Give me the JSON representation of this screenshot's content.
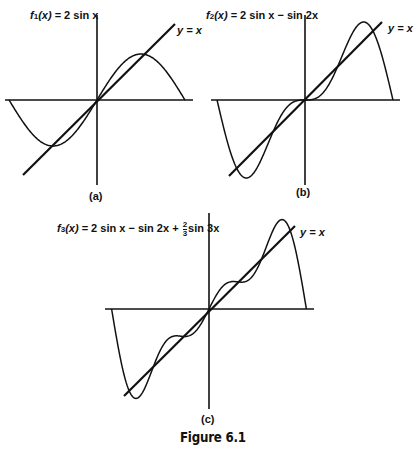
{
  "caption": "Figure 6.1",
  "panels": [
    {
      "tag": "(a)",
      "title": {
        "fname": "f",
        "sub": "1",
        "arg": "(x)",
        "expr": " = 2 sin x"
      },
      "line_label": "y = x"
    },
    {
      "tag": "(b)",
      "title": {
        "fname": "f",
        "sub": "2",
        "arg": "(x)",
        "expr": " = 2 sin x − sin 2x"
      },
      "line_label": "y = x"
    },
    {
      "tag": "(c)",
      "title": {
        "fname": "f",
        "sub": "3",
        "arg": "(x)",
        "expr_a": " = 2 sin x − sin 2x + ",
        "frac_num": "2",
        "frac_den": "3",
        "expr_b": "sin 3x"
      },
      "line_label": "y = x"
    }
  ],
  "chart_data": [
    {
      "type": "line",
      "title": "f1(x) = 2 sin x",
      "panel": "(a)",
      "x_range": [
        -3.14159,
        3.14159
      ],
      "series": [
        {
          "name": "f1(x) = 2 sin x",
          "x": [
            -3.14,
            -2.36,
            -1.57,
            -0.79,
            0,
            0.79,
            1.57,
            2.36,
            3.14
          ],
          "values": [
            0,
            -1.41,
            -2,
            -1.41,
            0,
            1.41,
            2,
            1.41,
            0
          ]
        },
        {
          "name": "y = x",
          "x": [
            -2.8,
            2.8
          ],
          "values": [
            -2.8,
            2.8
          ]
        }
      ],
      "xlabel": "",
      "ylabel": "",
      "grid": false
    },
    {
      "type": "line",
      "title": "f2(x) = 2 sin x − sin 2x",
      "panel": "(b)",
      "x_range": [
        -3.14159,
        3.14159
      ],
      "series": [
        {
          "name": "f2(x) = 2 sin x − sin 2x",
          "x": [
            -3.14,
            -2.09,
            -1.57,
            -0.79,
            0,
            0.79,
            1.57,
            2.09,
            3.14
          ],
          "values": [
            0,
            -2.6,
            -2,
            -0.41,
            0,
            0.41,
            2,
            2.6,
            0
          ]
        },
        {
          "name": "y = x",
          "x": [
            -2.8,
            2.8
          ],
          "values": [
            -2.8,
            2.8
          ]
        }
      ],
      "xlabel": "",
      "ylabel": "",
      "grid": false
    },
    {
      "type": "line",
      "title": "f3(x) = 2 sin x − sin 2x + (2/3) sin 3x",
      "panel": "(c)",
      "x_range": [
        -3.14159,
        3.14159
      ],
      "series": [
        {
          "name": "f3(x) = 2 sin x − sin 2x + (2/3) sin 3x",
          "x": [
            -3.14,
            -2.36,
            -1.57,
            -0.79,
            0,
            0.79,
            1.57,
            2.36,
            3.14
          ],
          "values": [
            0,
            -2.88,
            -1.33,
            -0.94,
            0,
            0.94,
            1.33,
            2.88,
            0
          ]
        },
        {
          "name": "y = x",
          "x": [
            -2.8,
            2.8
          ],
          "values": [
            -2.8,
            2.8
          ]
        }
      ],
      "xlabel": "",
      "ylabel": "",
      "grid": false
    }
  ]
}
